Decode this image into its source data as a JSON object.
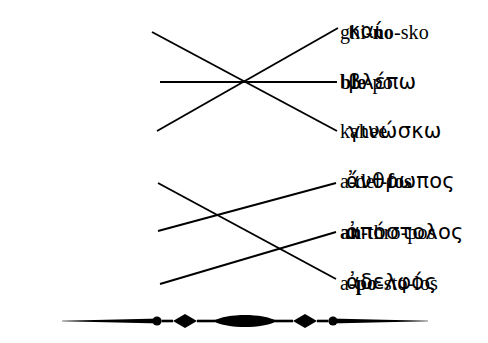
{
  "page": {
    "background_color": "#ffffff",
    "ink_color": "#000000",
    "width": 488,
    "height": 343
  },
  "groups": [
    {
      "name": "verbs-group",
      "left_column": [
        {
          "id": "ghi-no-sko",
          "pre": "ghi-",
          "stress": "no",
          "post": "-sko",
          "full": "ghi-no-sko",
          "y": 32
        },
        {
          "id": "ble-po",
          "pre": "",
          "stress": "ble",
          "post": "-po",
          "full": "ble-po",
          "y": 82
        },
        {
          "id": "kahee",
          "pre": "kahee",
          "stress": "",
          "post": "",
          "full": "kahee",
          "y": 131
        }
      ],
      "right_column": [
        {
          "id": "kai",
          "text": "καί",
          "y": 31
        },
        {
          "id": "blepo",
          "text": "βλέπω",
          "y": 82
        },
        {
          "id": "ginosko",
          "text": "γινώσκω",
          "y": 131
        }
      ],
      "connections": [
        {
          "from": "ghi-no-sko",
          "to": "ginosko",
          "x1": 152,
          "y1": 32,
          "x2": 337,
          "y2": 131
        },
        {
          "from": "ble-po",
          "to": "blepo",
          "x1": 160,
          "y1": 82,
          "x2": 337,
          "y2": 82
        },
        {
          "from": "kahee",
          "to": "kai",
          "x1": 157,
          "y1": 131,
          "x2": 338,
          "y2": 28
        }
      ]
    },
    {
      "name": "nouns-group",
      "left_column": [
        {
          "id": "a-del-fos",
          "pre": "a-del-",
          "stress": "fos",
          "post": "",
          "full": "a-del-fos",
          "y": 181
        },
        {
          "id": "an-thro-pos",
          "pre": "",
          "stress": "an",
          "post": "-thro-pos",
          "full": "an-thro-pos",
          "y": 232
        },
        {
          "id": "a-po-sto-los",
          "pre": "a-",
          "stress": "po",
          "post": "-sto-los",
          "full": "a-po-sto-los",
          "y": 283
        }
      ],
      "right_column": [
        {
          "id": "anthropos",
          "text": "ἄνθρωπος",
          "y": 181
        },
        {
          "id": "apostolos",
          "text": "ἀπόστολος",
          "y": 232
        },
        {
          "id": "adelfos",
          "text": "ἀδελφός",
          "y": 282
        }
      ],
      "connections": [
        {
          "from": "a-del-fos",
          "to": "adelfos",
          "x1": 158,
          "y1": 183,
          "x2": 336,
          "y2": 279
        },
        {
          "from": "an-thro-pos",
          "to": "anthropos",
          "x1": 158,
          "y1": 231,
          "x2": 336,
          "y2": 183
        },
        {
          "from": "a-po-sto-los",
          "to": "apostolos",
          "x1": 160,
          "y1": 284,
          "x2": 336,
          "y2": 232
        }
      ]
    }
  ],
  "ornament": {
    "name": "decorative-divider",
    "description": "horizontal rule with central lens, flanking diamonds and dots",
    "left_x": 62,
    "right_x": 428,
    "center_x": 245,
    "center_y": 21,
    "lens_half_width": 32,
    "lens_half_height": 8,
    "diamond_offset": 60,
    "diamond_half_width": 12,
    "diamond_half_height": 7,
    "dot_offset": 88,
    "dot_radius": 4.5,
    "taper_end_half_height": 0.35,
    "taper_inner_half_height": 2.6
  },
  "lines": {
    "stroke_width": 1.9,
    "color": "#000000"
  }
}
